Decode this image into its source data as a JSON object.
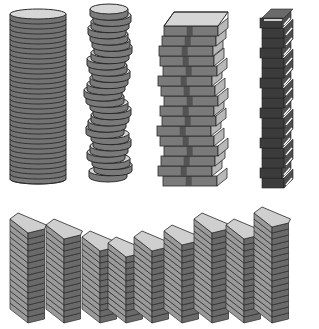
{
  "illustration": {
    "description": "Five stacks illustration: coin column, wobbly coin stack, book stack, dark block tower, row of ingot stacks",
    "background": "#ffffff",
    "colors": {
      "outline": "#2a2a2a",
      "top_light": "#d6d6d6",
      "side_mid": "#7a7a7a",
      "side_dark": "#5a5a5a",
      "dark_block": "#3c3c3c",
      "dark_block_side": "#4e4e4e",
      "ingot_top": "#cfcfcf",
      "ingot_front": "#9a9a9a",
      "ingot_side": "#6a6a6a",
      "book_spine": "#4a4a4a",
      "highlight": "#ffffff"
    },
    "coin_column": {
      "cx": 38,
      "top": 14,
      "bottom": 184,
      "rx": 28,
      "ry": 5,
      "rings": 34
    },
    "wobbly_coins": {
      "bottom": 182,
      "top": 14,
      "rx": 19,
      "ry": 5,
      "count": 27,
      "offsets": [
        0,
        5,
        3,
        -2,
        1,
        4,
        2,
        -3,
        -1,
        2,
        4,
        1,
        -3,
        -5,
        -2,
        1,
        3,
        0,
        -2,
        2,
        5,
        3,
        1,
        -1,
        2,
        4,
        1
      ]
    },
    "book_stack": {
      "x": 160,
      "width": 54,
      "bottom": 186,
      "book_h": 10,
      "count": 16,
      "offsets": [
        3,
        -2,
        1,
        4,
        0,
        -3,
        2,
        0,
        4,
        1,
        -2,
        3,
        0,
        -1,
        2,
        4
      ]
    },
    "dark_tower": {
      "x": 262,
      "width": 22,
      "bottom": 188,
      "count": 17,
      "unit": 10
    },
    "ingot_row": {
      "columns": [
        {
          "x": 10,
          "top": 222,
          "n": 15
        },
        {
          "x": 46,
          "top": 228,
          "n": 14
        },
        {
          "x": 82,
          "top": 240,
          "n": 12
        },
        {
          "x": 108,
          "top": 244,
          "n": 11
        },
        {
          "x": 134,
          "top": 237,
          "n": 12
        },
        {
          "x": 164,
          "top": 230,
          "n": 13
        },
        {
          "x": 194,
          "top": 220,
          "n": 15
        },
        {
          "x": 226,
          "top": 226,
          "n": 14
        },
        {
          "x": 254,
          "top": 212,
          "n": 16
        }
      ],
      "bottom": 323,
      "front_w": 30,
      "depth_dx": 18,
      "depth_dy": 14,
      "unit": 6
    }
  }
}
